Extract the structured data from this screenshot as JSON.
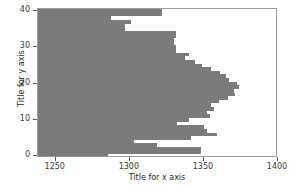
{
  "chart_data": {
    "type": "bar",
    "orientation": "horizontal",
    "title": "",
    "xlabel": "Title for x axis",
    "ylabel": "Title for y axis",
    "xlim": [
      1238,
      1400
    ],
    "ylim": [
      -0.5,
      40.5
    ],
    "xticks": [
      1250,
      1300,
      1350,
      1400
    ],
    "yticks": [
      0,
      10,
      20,
      30,
      40
    ],
    "grid": false,
    "legend": null,
    "bar_color": "#7b7b7b",
    "frame_color": "#9a9a9a",
    "background": "#ffffff",
    "bar_base": 1238,
    "categories": [
      0,
      1,
      2,
      3,
      4,
      5,
      6,
      7,
      8,
      9,
      10,
      11,
      12,
      13,
      14,
      15,
      16,
      17,
      18,
      19,
      20,
      21,
      22,
      23,
      24,
      25,
      26,
      27,
      28,
      29,
      30,
      31,
      32,
      33,
      34,
      35,
      36,
      37,
      38,
      39,
      40
    ],
    "values": [
      1285,
      1348,
      1348,
      1318,
      1303,
      1341,
      1359,
      1352,
      1350,
      1332,
      1340,
      1354,
      1352,
      1357,
      1355,
      1360,
      1366,
      1371,
      1370,
      1374,
      1372,
      1367,
      1365,
      1361,
      1355,
      1349,
      1344,
      1337,
      1340,
      1331,
      1331,
      1330,
      1330,
      1331,
      1331,
      1297,
      1297,
      1301,
      1287,
      1322,
      1322
    ]
  }
}
